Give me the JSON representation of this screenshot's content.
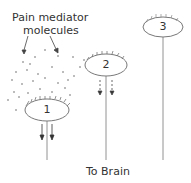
{
  "diagram": {
    "title_label_line1": "Pain mediator",
    "title_label_line2": "molecules",
    "neurons": [
      {
        "id": "1",
        "label": "1",
        "cx": 47,
        "cy": 110,
        "signal": "strong"
      },
      {
        "id": "2",
        "label": "2",
        "cx": 106,
        "cy": 65,
        "signal": "weak"
      },
      {
        "id": "3",
        "label": "3",
        "cx": 163,
        "cy": 27,
        "signal": "none"
      }
    ],
    "bottom_label": "To Brain",
    "colors": {
      "stroke": "#555555",
      "text": "#333333",
      "dots": "#666666"
    }
  }
}
